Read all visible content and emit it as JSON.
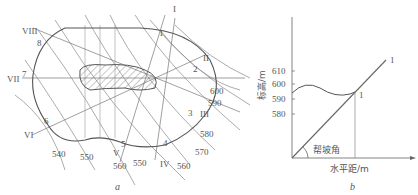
{
  "figure_a": {
    "caption": "a",
    "contour_labels": [
      "540",
      "550",
      "560",
      "550",
      "560",
      "570",
      "580",
      "590",
      "600"
    ],
    "section_roman": [
      "I",
      "II",
      "III",
      "IV",
      "V",
      "VI",
      "VII",
      "VIII"
    ],
    "section_points": [
      "1",
      "2",
      "3",
      "4",
      "5",
      "6",
      "7",
      "8"
    ]
  },
  "figure_b": {
    "caption": "b",
    "ylabel": "标高/m",
    "xlabel": "水平距/m",
    "yticks": [
      "610",
      "600",
      "590",
      "580"
    ],
    "angle_label": "帮坡角",
    "line_label_top": "1",
    "line_label_mid": "1"
  },
  "colors": {
    "line": "#6a6a6a",
    "boundary": "#555555",
    "text": "#555555"
  }
}
